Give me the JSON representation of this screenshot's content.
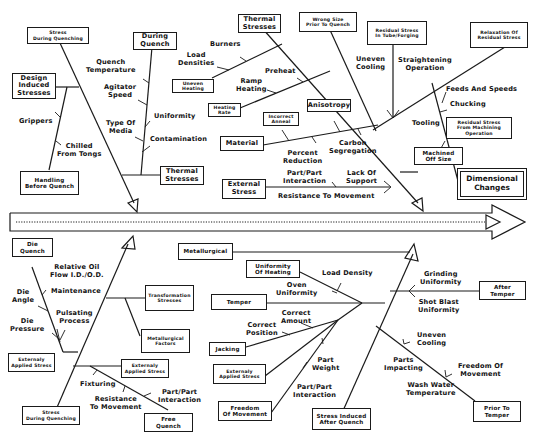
{
  "diagram": {
    "type": "fishbone (Ishikawa) cause-and-effect diagram",
    "effect": "Dimensional\nChanges",
    "spine": {
      "style": "double-line arrow with dotted center line",
      "color": "#1a1a1a"
    },
    "upper_branches": [
      {
        "id": "during-quench",
        "cause": "Stress\nDuring Quenching",
        "sub_causes": [
          {
            "label": "Design\nInduced\nStresses",
            "children": [
              "Grippers",
              "Chilled\nFrom Tongs",
              "Handling\nBefore Quench"
            ]
          },
          {
            "label": "During\nQuench",
            "children": [
              "Quench\nTemperature",
              "Agitator\nSpeed",
              "Uniformity",
              "Type Of\nMedia",
              "Contamination"
            ]
          },
          {
            "label": "Thermal\nStresses",
            "children": []
          }
        ]
      },
      {
        "id": "thermal",
        "cause": "Thermal\nStresses",
        "sub_causes": [
          {
            "label": "Uneven\nHeating",
            "children": [
              "Burners",
              "Load\nDensities"
            ]
          },
          {
            "label": "Heating\nRate",
            "children": [
              "Preheat",
              "Ramp\nHeating"
            ]
          },
          {
            "label": "Material",
            "children": [
              "Incorrect\nAnneal",
              "Anisotropy",
              "Percent\nReduction",
              "Carbon\nSegregation"
            ]
          },
          {
            "label": "External\nStress",
            "children": [
              "Part/Part\nInteraction",
              "Lack Of\nSupport",
              "Resistance To Movement"
            ]
          }
        ]
      },
      {
        "id": "wrong-size",
        "cause": "Wrong Size\nPrior To Quench",
        "sub_causes": []
      },
      {
        "id": "residual",
        "cause": "Relaxation Of\nResidual Stress",
        "sub_causes": [
          {
            "label": "Residual Stress\nIn Tube/Forging",
            "children": [
              "Uneven\nCooling",
              "Straightening\nOperation"
            ]
          },
          {
            "label": "Residual Stress\nFrom Machining\nOperation",
            "children": [
              "Feeds And Speeds",
              "Chucking",
              "Tooling"
            ]
          },
          {
            "label": "Machined\nOff Size",
            "children": []
          }
        ]
      }
    ],
    "lower_branches": [
      {
        "id": "quench-lower",
        "cause": "Stress\nDuring Quenching",
        "sub_causes": [
          {
            "label": "Die\nQuench",
            "children": [
              "Relative Oil\nFlow I.D./O.D.",
              "Die\nAngle",
              "Maintenance",
              "Die\nPressure",
              "Pulsating\nProcess"
            ]
          },
          {
            "label": "Externaly\nApplied Stress",
            "children": []
          },
          {
            "label": "Transformation\nStresses",
            "children": []
          },
          {
            "label": "Metallurgical\nFactors",
            "children": []
          },
          {
            "label": "Externaly\nApplied Stress",
            "children": [
              "Fixturing",
              "Resistance\nTo Movement",
              "Part/Part\nInteraction"
            ]
          },
          {
            "label": "Free\nQuench",
            "children": []
          }
        ]
      },
      {
        "id": "after-quench",
        "cause": "Stress Induced\nAfter Quench",
        "sub_causes": [
          {
            "label": "Metallurgical",
            "children": []
          },
          {
            "label": "Uniformity\nOf Heating",
            "children": [
              "Load Density",
              "Oven\nUniformity"
            ]
          },
          {
            "label": "Temper",
            "children": [
              "Correct\nAmount",
              "Correct\nPosition"
            ]
          },
          {
            "label": "Jacking",
            "children": []
          },
          {
            "label": "Externaly\nApplied Stress",
            "children": [
              "Part\nWeight",
              "Part/Part\nInteraction"
            ]
          },
          {
            "label": "Freedom\nOf Movement",
            "children": []
          },
          {
            "label": "After\nTemper",
            "children": [
              "Grinding\nUniformity",
              "Shot Blast\nUniformity"
            ]
          },
          {
            "label": "Prior To\nTemper",
            "children": [
              "Uneven\nCooling",
              "Parts\nImpacting",
              "Freedom Of\nMovement",
              "Wash Water\nTemperature"
            ]
          }
        ]
      }
    ]
  },
  "boxes": {
    "stress_quench_top": "Stress\nDuring Quenching",
    "design_induced": "Design\nInduced\nStresses",
    "handling": "Handling\nBefore Quench",
    "during_quench": "During\nQuench",
    "thermal_small": "Thermal\nStresses",
    "thermal_top": "Thermal\nStresses",
    "uneven_heating": "Uneven\nHeating",
    "heating_rate": "Heating\nRate",
    "incorrect_anneal": "Incorrect\nAnneal",
    "anisotropy": "Anisotropy",
    "material": "Material",
    "external_stress": "External\nStress",
    "wrong_size": "Wrong Size\nPrior To Quench",
    "residual_tube": "Residual Stress\nIn Tube/Forging",
    "relaxation": "Relaxation Of\nResidual Stress",
    "residual_machining": "Residual Stress\nFrom Machining\nOperation",
    "machined_off": "Machined\nOff Size",
    "effect": "Dimensional\nChanges",
    "die_quench": "Die\nQuench",
    "ext_applied_left": "Externaly\nApplied Stress",
    "stress_quench_bottom": "Stress\nDuring Quenching",
    "transformation": "Transformation\nStresses",
    "metallurgical_factors": "Metallurgical\nFactors",
    "ext_applied_mid": "Externaly\nApplied Stress",
    "free_quench": "Free\nQuench",
    "metallurgical": "Metallurgical",
    "uniformity_heating": "Uniformity\nOf Heating",
    "temper": "Temper",
    "jacking": "Jacking",
    "ext_applied_right": "Externaly\nApplied Stress",
    "freedom_movement_box": "Freedom\nOf Movement",
    "stress_after_quench": "Stress Induced\nAfter Quench",
    "after_temper": "After\nTemper",
    "prior_temper": "Prior To\nTemper"
  },
  "labels": {
    "grippers": "Grippers",
    "chilled": "Chilled\nFrom Tongs",
    "quench_temp": "Quench\nTemperature",
    "agitator": "Agitator\nSpeed",
    "uniformity": "Uniformity",
    "type_media": "Type Of\nMedia",
    "contamination": "Contamination",
    "burners": "Burners",
    "load_densities": "Load\nDensities",
    "preheat": "Preheat",
    "ramp_heating": "Ramp\nHeating",
    "percent_reduction": "Percent\nReduction",
    "carbon_seg": "Carbon\nSegregation",
    "part_part_top": "Part/Part\nInteraction",
    "lack_support": "Lack Of\nSupport",
    "resistance_top": "Resistance To Movement",
    "uneven_cooling_top": "Uneven\nCooling",
    "straightening": "Straightening\nOperation",
    "feeds_speeds": "Feeds And Speeds",
    "chucking": "Chucking",
    "tooling": "Tooling",
    "relative_oil": "Relative Oil\nFlow I.D./O.D.",
    "die_angle": "Die\nAngle",
    "maintenance": "Maintenance",
    "die_pressure": "Die\nPressure",
    "pulsating": "Pulsating\nProcess",
    "fixturing": "Fixturing",
    "resistance_bottom": "Resistance\nTo Movement",
    "part_part_bottom_left": "Part/Part\nInteraction",
    "load_density": "Load Density",
    "oven_uniformity": "Oven\nUniformity",
    "correct_amount": "Correct\nAmount",
    "correct_position": "Correct\nPosition",
    "part_weight": "Part\nWeight",
    "part_part_bottom_mid": "Part/Part\nInteraction",
    "grinding": "Grinding\nUniformity",
    "shot_blast": "Shot Blast\nUniformity",
    "uneven_cooling_bottom": "Uneven\nCooling",
    "parts_impacting": "Parts\nImpacting",
    "freedom_of_movement": "Freedom Of\nMovement",
    "wash_water": "Wash Water\nTemperature"
  }
}
